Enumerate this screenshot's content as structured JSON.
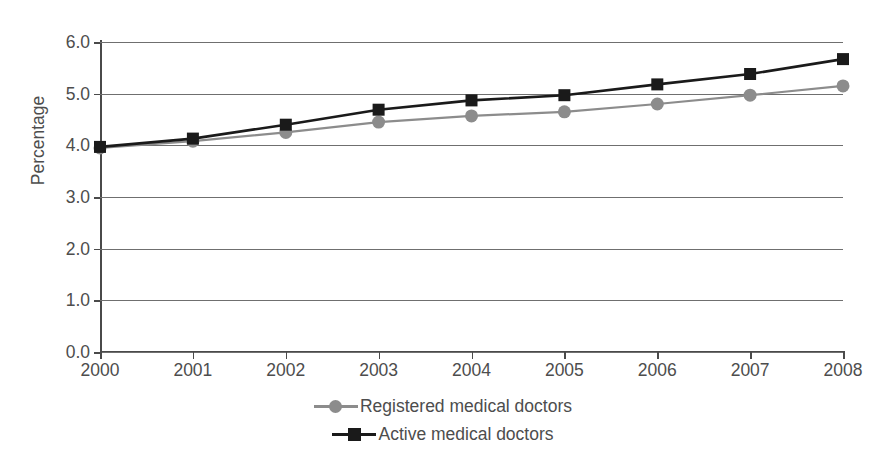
{
  "chart_data": {
    "type": "line",
    "title": "",
    "xlabel": "",
    "ylabel": "Percentage",
    "categories": [
      "2000",
      "2001",
      "2002",
      "2003",
      "2004",
      "2005",
      "2006",
      "2007",
      "2008"
    ],
    "x": [
      2000,
      2001,
      2002,
      2003,
      2004,
      2005,
      2006,
      2007,
      2008
    ],
    "xlim": [
      2000,
      2008
    ],
    "ylim": [
      0.0,
      6.0
    ],
    "ytick_labels": [
      "0.0",
      "1.0",
      "2.0",
      "3.0",
      "4.0",
      "5.0",
      "6.0"
    ],
    "ytick_values": [
      0.0,
      1.0,
      2.0,
      3.0,
      4.0,
      5.0,
      6.0
    ],
    "grid": "horizontal",
    "legend_position": "bottom-center",
    "series": [
      {
        "name": "Registered medical doctors",
        "marker": "circle",
        "color": "#8c8c8c",
        "values": [
          3.95,
          4.08,
          4.25,
          4.45,
          4.57,
          4.65,
          4.8,
          4.97,
          5.15
        ]
      },
      {
        "name": "Active medical doctors",
        "marker": "square",
        "color": "#1a1a1a",
        "values": [
          3.97,
          4.13,
          4.4,
          4.69,
          4.87,
          4.97,
          5.18,
          5.38,
          5.67
        ]
      }
    ]
  },
  "axis": {
    "y_title": "Percentage"
  },
  "legend": {
    "items": [
      {
        "label": "Registered medical doctors"
      },
      {
        "label": "Active medical doctors"
      }
    ]
  },
  "colors": {
    "registered": "#8c8c8c",
    "active": "#1a1a1a",
    "grid": "#6f6f6f",
    "axis": "#4a4a4a",
    "text": "#4d4d4d",
    "background": "#ffffff"
  }
}
